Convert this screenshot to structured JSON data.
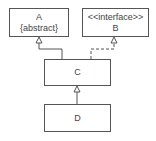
{
  "diagram": {
    "type": "uml-class-diagram",
    "classes": {
      "A": {
        "name": "A",
        "stereotype": "{abstract}"
      },
      "B": {
        "name": "B",
        "stereotype": "<<interface>>"
      },
      "C": {
        "name": "C"
      },
      "D": {
        "name": "D"
      }
    },
    "relations": [
      {
        "from": "C",
        "to": "A",
        "kind": "generalization"
      },
      {
        "from": "C",
        "to": "B",
        "kind": "realization"
      },
      {
        "from": "D",
        "to": "C",
        "kind": "generalization"
      }
    ]
  }
}
